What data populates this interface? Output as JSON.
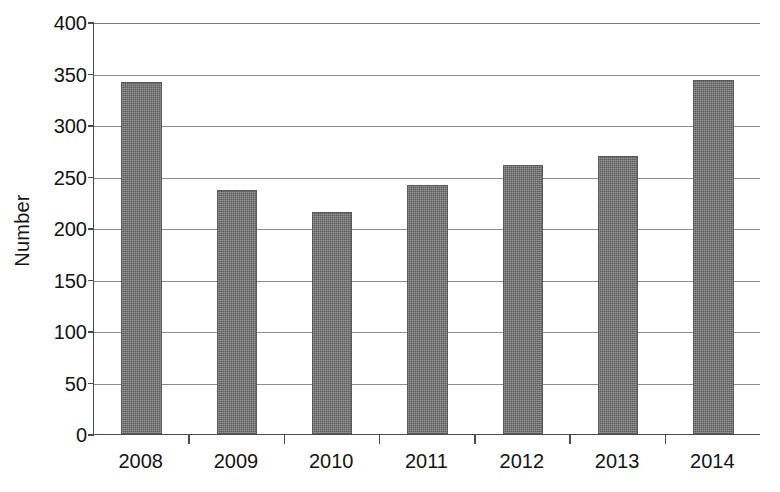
{
  "chart_data": {
    "type": "bar",
    "title": "",
    "subtitle": "",
    "xlabel": "",
    "ylabel": "Number",
    "categories": [
      "2008",
      "2009",
      "2010",
      "2011",
      "2012",
      "2013",
      "2014"
    ],
    "values": [
      342,
      237,
      216,
      242,
      261,
      270,
      344
    ],
    "series": [
      {
        "name": "Number",
        "values": [
          342,
          237,
          216,
          242,
          261,
          270,
          344
        ]
      }
    ],
    "ylim": [
      0,
      400
    ],
    "ytick_values": [
      0,
      50,
      100,
      150,
      200,
      250,
      300,
      350,
      400
    ],
    "ytick_labels": [
      "0",
      "50",
      "100",
      "150",
      "200",
      "250",
      "300",
      "350",
      "400"
    ],
    "grid": "horizontal",
    "legend": "none",
    "bar_color": "#6f6f6f",
    "axis_color": "#4a4a4a",
    "gridline_color": "#8c8c8c",
    "background_color": "#ffffff",
    "text_color": "#141414"
  }
}
